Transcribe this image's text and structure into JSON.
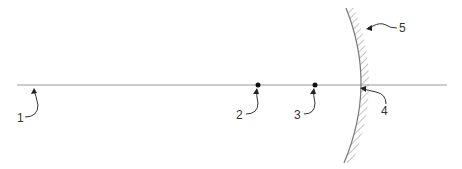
{
  "diagram": {
    "type": "optical-axis-concave-mirror",
    "colors": {
      "axis": "#999999",
      "ink": "#222222",
      "hatch": "#888888",
      "background": "#ffffff"
    },
    "labels": [
      {
        "id": "1",
        "text": "1",
        "refers_to": "optical axis"
      },
      {
        "id": "2",
        "text": "2",
        "refers_to": "point on axis"
      },
      {
        "id": "3",
        "text": "3",
        "refers_to": "point on axis"
      },
      {
        "id": "4",
        "text": "4",
        "refers_to": "mirror vertex"
      },
      {
        "id": "5",
        "text": "5",
        "refers_to": "mirror surface"
      }
    ]
  }
}
